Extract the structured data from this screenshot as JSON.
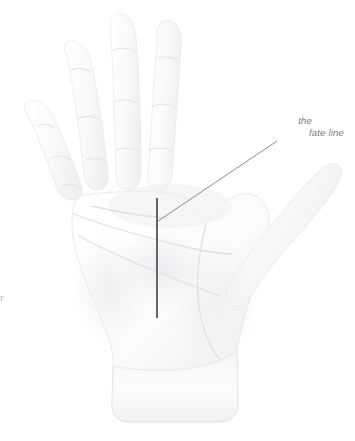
{
  "figure": {
    "kind": "palmistry-diagram",
    "background_color": "#ffffff",
    "width": 355,
    "height": 441
  },
  "annotation": {
    "label_line_1": "the",
    "label_line_2": "fate line",
    "label_color": "#7a7a7d",
    "leader_line_color": "#6e6e72",
    "marker_line_color": "#5e5e62",
    "marker": {
      "x": 157,
      "y_top": 198,
      "y_bottom": 318
    },
    "leader": {
      "x_start": 158,
      "y_start": 221,
      "x_end": 277,
      "y_end": 141
    }
  },
  "hand": {
    "skin_light": "#fefefe",
    "skin_mid": "#f4f4f5",
    "skin_shadow": "#e6e6e8",
    "outline_color": "#dcdcde",
    "crease_color": "#e2e2e5",
    "parts": [
      "index-finger",
      "middle-finger",
      "ring-finger",
      "little-finger",
      "thumb",
      "palm",
      "wrist"
    ]
  },
  "page_edge": {
    "partial_glyph": "r"
  }
}
